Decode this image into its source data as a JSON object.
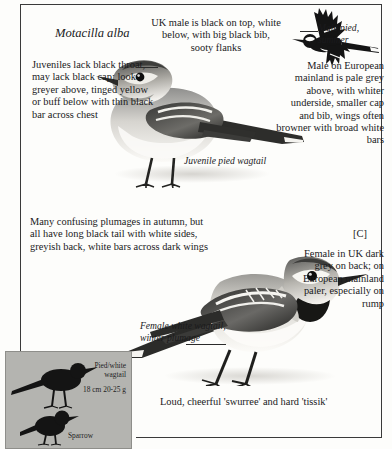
{
  "plate": {
    "scientific_name": "Motacilla\nalba",
    "juvenile_note": "Juveniles lack black throat, may lack black cap; look greyer above, tinged yellow or buff below with thin black bar across chest",
    "uk_male_note": "UK male is black on top, white below, with big black bib, sooty flanks",
    "male_pied_caption": "Male pied, summer",
    "european_male_note": "Male on European mainland is pale grey above, with whiter underside, smaller cap and bib, wings often browner with broad white bars",
    "juvenile_caption": "Juvenile pied wagtail",
    "autumn_note": "Many confusing plumages in autumn, but all have long black tail with white sides, greyish back, white bars across dark wings",
    "c_label": "[C]",
    "female_note": "Female in UK dark grey on back; on European mainland paler, especially on rump",
    "female_caption": "Female white wagtail, winter plumage",
    "voice_note": "Loud, cheerful 'swurree' and hard 'tissik'"
  },
  "size_inset": {
    "species_label": "Pied/white wagtail",
    "measurements": "18 cm  20-25 g",
    "comparison_label": "Sparrow",
    "background_color": "#b4b4b0",
    "silhouette_color": "#141414"
  },
  "illustrations": [
    {
      "name": "juvenile-pied-wagtail",
      "pose": "standing-left"
    },
    {
      "name": "male-pied-wagtail-flight",
      "pose": "flying-left"
    },
    {
      "name": "female-white-wagtail-winter",
      "pose": "standing-left"
    }
  ],
  "colors": {
    "text": "#1a1a1c",
    "rule": "#3a3a3a",
    "page": "#fdfdfb"
  }
}
